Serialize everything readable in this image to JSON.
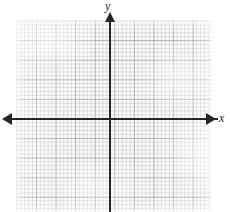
{
  "figure": {
    "type": "coordinate-plane",
    "background_color": "#ffffff",
    "paper_color": "#fbfbfa"
  },
  "axes": {
    "x_axis": {
      "label": "x",
      "color": "#262626",
      "arrow_left": "arrow-left",
      "arrow_right": "arrow-right"
    },
    "y_axis": {
      "label": "y",
      "color": "#262626",
      "arrow_up": "arrow-up"
    },
    "origin": {
      "x": 110,
      "y": 119
    }
  },
  "grid": {
    "minor_color": "#b0aeb2",
    "major_color": "#969498",
    "minor_spacing_px": 3.92,
    "major_every_n_minor": 5,
    "columns_minor": 50,
    "rows_minor": 49
  },
  "chart_data": {
    "type": "scatter",
    "title": "",
    "xlabel": "x",
    "ylabel": "y",
    "series": [],
    "x": [],
    "values": [],
    "xlim": [
      -24,
      26
    ],
    "ylim": [
      -24,
      25
    ],
    "grid": true,
    "legend": "none",
    "annotations": []
  }
}
